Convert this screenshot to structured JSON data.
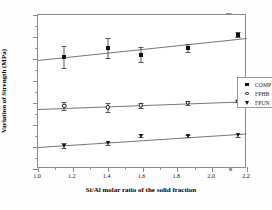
{
  "chart_data": {
    "type": "scatter",
    "title": "",
    "xlabel": "Si/Al molar ratio of the solid fraction",
    "ylabel": "Variation of Strength (MPa)",
    "xlim": [
      1.0,
      2.2
    ],
    "ylim": [
      0,
      70
    ],
    "xticks": [
      "1.0",
      "1.2",
      "1.4",
      "1.6",
      "1.8",
      "2.0",
      "2.2"
    ],
    "xtick_values": [
      1.0,
      1.2,
      1.4,
      1.6,
      1.8,
      2.0,
      2.2
    ],
    "yticks": [
      "0",
      "10",
      "20",
      "30",
      "40",
      "50",
      "60",
      "70"
    ],
    "ytick_values": [
      0,
      10,
      20,
      30,
      40,
      50,
      60,
      70
    ],
    "grid": false,
    "legend_position": "center-right",
    "x": [
      1.15,
      1.4,
      1.59,
      1.86,
      2.15
    ],
    "series": [
      {
        "name": "COMP",
        "marker": "filled-square",
        "values": [
          51.0,
          55.0,
          52.0,
          55.0,
          61.0
        ],
        "errors": [
          5.0,
          4.5,
          3.5,
          1.8,
          1.2
        ],
        "fit_start": 49.5,
        "fit_end": 59.5
      },
      {
        "name": "FPHB",
        "marker": "open-circle",
        "values": [
          28.7,
          28.0,
          29.0,
          30.0,
          30.8
        ],
        "errors": [
          1.7,
          2.0,
          1.2,
          0.7,
          0.5
        ],
        "fit_start": 27.5,
        "fit_end": 31.0
      },
      {
        "name": "FPUN",
        "marker": "filled-triangle-down",
        "values": [
          10.6,
          11.8,
          15.1,
          15.0,
          15.3
        ],
        "errors": [
          1.2,
          0.7,
          0.7,
          0.6,
          0.6
        ],
        "fit_start": 10.2,
        "fit_end": 16.4
      }
    ]
  },
  "legend": {
    "items": [
      {
        "label": "COMP",
        "symbol": "filled-square"
      },
      {
        "label": "FPHB",
        "symbol": "open-circle"
      },
      {
        "label": "FPUN",
        "symbol": "filled-triangle-down"
      }
    ]
  },
  "axes": {
    "y_title": "Variation of Strength (MPa)",
    "x_title": "Si/Al molar ratio of the solid fraction"
  }
}
